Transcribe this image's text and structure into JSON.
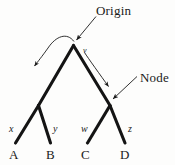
{
  "figure": {
    "type": "phylogenetic-tree-diagram",
    "background_color": "#fdfdfc",
    "ink_color": "#1a1a1a"
  },
  "callouts": {
    "origin": {
      "label": "Origin",
      "icon": "arrow-pointer-icon"
    },
    "node": {
      "label": "Node",
      "icon": "arrow-pointer-icon"
    }
  },
  "internal_nodes": {
    "root_child": {
      "label": "v"
    }
  },
  "branches": [
    {
      "label": "x"
    },
    {
      "label": "y"
    },
    {
      "label": "w"
    },
    {
      "label": "z"
    }
  ],
  "taxa": [
    {
      "label": "A"
    },
    {
      "label": "B"
    },
    {
      "label": "C"
    },
    {
      "label": "D"
    }
  ]
}
